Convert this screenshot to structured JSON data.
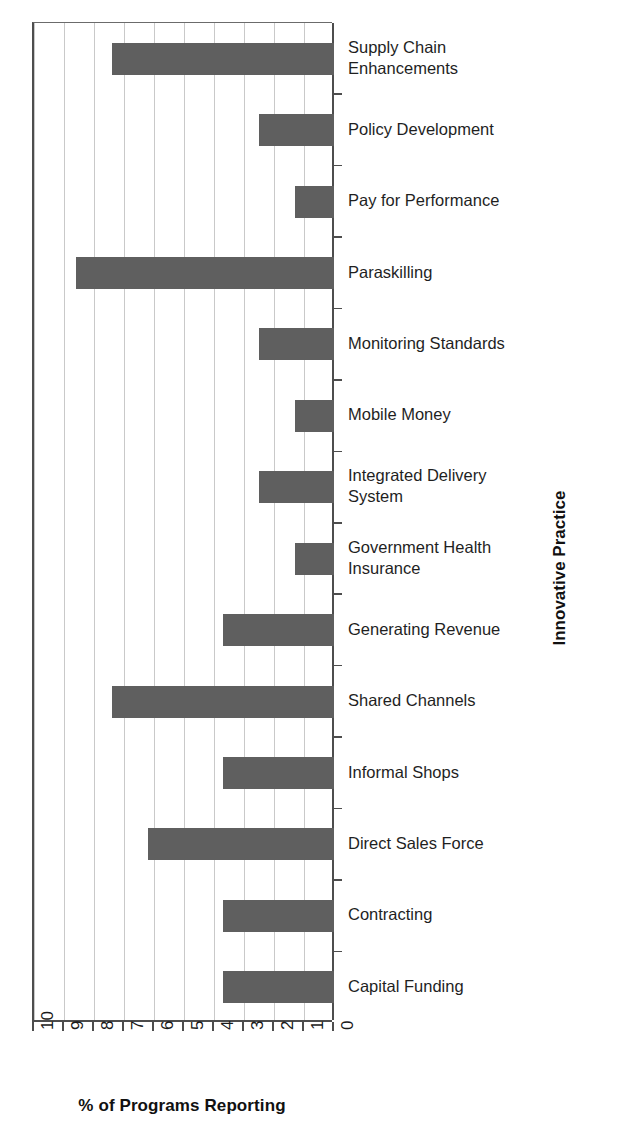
{
  "chart_data": {
    "type": "bar",
    "orientation": "horizontal",
    "title": "",
    "xlabel": "% of Programs Reporting",
    "ylabel": "Innovative Practice",
    "xlim": [
      10,
      0
    ],
    "x_axis_reversed": true,
    "xticks": [
      "10",
      "9",
      "8",
      "7",
      "6",
      "5",
      "4",
      "3",
      "2",
      "1",
      "0"
    ],
    "grid": "vertical",
    "legend": "none",
    "bar_color": "#5f5f5f",
    "categories": [
      "Supply Chain\nEnhancements",
      "Policy Development",
      "Pay for Performance",
      "Paraskilling",
      "Monitoring Standards",
      "Mobile Money",
      "Integrated Delivery\nSystem",
      "Government Health\nInsurance",
      "Generating Revenue",
      "Shared Channels",
      "Informal Shops",
      "Direct Sales Force",
      "Contracting",
      "Capital Funding"
    ],
    "values": [
      7.4,
      2.5,
      1.3,
      8.6,
      2.5,
      1.3,
      2.5,
      1.3,
      3.7,
      7.4,
      3.7,
      6.2,
      3.7,
      3.7
    ]
  }
}
